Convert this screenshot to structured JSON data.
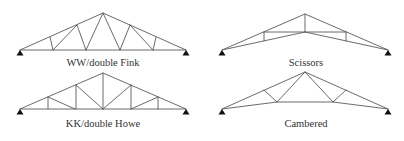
{
  "figure": {
    "trusses": [
      {
        "id": "ww-double-fink",
        "label": "WW/double Fink",
        "label_pos": [
          103,
          58
        ],
        "top_chord": [
          [
            20,
            50
          ],
          [
            103,
            13
          ],
          [
            186,
            50
          ]
        ],
        "bottom_chord": [
          [
            20,
            50
          ],
          [
            186,
            50
          ]
        ],
        "webs": [
          [
            [
              50,
              37
            ],
            [
              53,
              50
            ]
          ],
          [
            [
              53,
              50
            ],
            [
              77,
              25
            ]
          ],
          [
            [
              77,
              25
            ],
            [
              86,
              50
            ]
          ],
          [
            [
              86,
              50
            ],
            [
              103,
              13
            ]
          ],
          [
            [
              103,
              13
            ],
            [
              120,
              50
            ]
          ],
          [
            [
              120,
              50
            ],
            [
              130,
              25
            ]
          ],
          [
            [
              130,
              25
            ],
            [
              153,
              50
            ]
          ],
          [
            [
              153,
              50
            ],
            [
              156,
              37
            ]
          ]
        ],
        "supports": [
          [
            20,
            50
          ],
          [
            186,
            50
          ]
        ]
      },
      {
        "id": "scissors",
        "label": "Scissors",
        "label_pos": [
          306,
          58
        ],
        "top_chord": [
          [
            222,
            50
          ],
          [
            305,
            14
          ],
          [
            388,
            50
          ]
        ],
        "bottom_chord": [
          [
            222,
            50
          ],
          [
            305,
            32
          ],
          [
            388,
            50
          ]
        ],
        "webs": [
          [
            [
              305,
              14
            ],
            [
              305,
              32
            ]
          ],
          [
            [
              264,
              32
            ],
            [
              264,
              41
            ]
          ],
          [
            [
              264,
              32
            ],
            [
              346,
              32
            ]
          ],
          [
            [
              346,
              32
            ],
            [
              346,
              41
            ]
          ]
        ],
        "supports": [
          [
            222,
            50
          ],
          [
            388,
            50
          ]
        ]
      },
      {
        "id": "kk-double-howe",
        "label": "KK/double Howe",
        "label_pos": [
          103,
          119
        ],
        "top_chord": [
          [
            20,
            109
          ],
          [
            103,
            73
          ],
          [
            186,
            109
          ]
        ],
        "bottom_chord": [
          [
            20,
            109
          ],
          [
            186,
            109
          ]
        ],
        "webs": [
          [
            [
              48,
              97
            ],
            [
              48,
              109
            ]
          ],
          [
            [
              48,
              97
            ],
            [
              75,
              109
            ]
          ],
          [
            [
              76,
              85
            ],
            [
              76,
              109
            ]
          ],
          [
            [
              76,
              85
            ],
            [
              103,
              109
            ]
          ],
          [
            [
              103,
              73
            ],
            [
              103,
              109
            ]
          ],
          [
            [
              103,
              109
            ],
            [
              131,
              85
            ]
          ],
          [
            [
              131,
              85
            ],
            [
              131,
              109
            ]
          ],
          [
            [
              131,
              109
            ],
            [
              158,
              97
            ]
          ],
          [
            [
              158,
              97
            ],
            [
              158,
              109
            ]
          ]
        ],
        "supports": [
          [
            20,
            109
          ],
          [
            186,
            109
          ]
        ]
      },
      {
        "id": "cambered",
        "label": "Cambered",
        "label_pos": [
          306,
          119
        ],
        "top_chord": [
          [
            222,
            109
          ],
          [
            305,
            72
          ],
          [
            388,
            109
          ]
        ],
        "bottom_chord": [
          [
            222,
            109
          ],
          [
            277,
            102
          ],
          [
            333,
            102
          ],
          [
            388,
            109
          ]
        ],
        "webs": [
          [
            [
              264,
              90
            ],
            [
              277,
              102
            ]
          ],
          [
            [
              277,
              102
            ],
            [
              305,
              72
            ]
          ],
          [
            [
              305,
              72
            ],
            [
              333,
              102
            ]
          ],
          [
            [
              333,
              102
            ],
            [
              346,
              90
            ]
          ]
        ],
        "supports": [
          [
            222,
            109
          ],
          [
            388,
            109
          ]
        ]
      }
    ],
    "colors": {
      "member": "#5a5a5a",
      "support": "#111111",
      "label": "#333333",
      "background": "#ffffff"
    }
  }
}
